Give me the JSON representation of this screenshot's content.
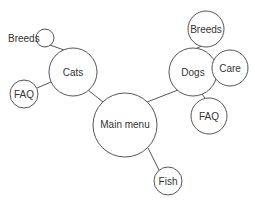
{
  "diagram": {
    "type": "bubble-sitemap",
    "nodes": {
      "main": {
        "label": "Main menu",
        "cx": 125,
        "cy": 125,
        "r": 32
      },
      "cats": {
        "label": "Cats",
        "cx": 73,
        "cy": 72,
        "r": 24
      },
      "cats_breeds": {
        "label": "Breeds",
        "cx": 45,
        "cy": 38,
        "r": 9,
        "label_x": 8,
        "label_y": 42
      },
      "cats_faq": {
        "label": "FAQ",
        "cx": 24,
        "cy": 94,
        "r": 14
      },
      "dogs": {
        "label": "Dogs",
        "cx": 193,
        "cy": 72,
        "r": 24
      },
      "dogs_breeds": {
        "label": "Breeds",
        "cx": 206,
        "cy": 29,
        "r": 18
      },
      "dogs_care": {
        "label": "Care",
        "cx": 230,
        "cy": 68,
        "r": 18
      },
      "dogs_faq": {
        "label": "FAQ",
        "cx": 209,
        "cy": 116,
        "r": 18
      },
      "fish": {
        "label": "Fish",
        "cx": 168,
        "cy": 181,
        "r": 14
      }
    },
    "edges": [
      [
        "main",
        "cats"
      ],
      [
        "main",
        "dogs"
      ],
      [
        "main",
        "fish"
      ],
      [
        "cats",
        "cats_breeds"
      ],
      [
        "cats",
        "cats_faq"
      ],
      [
        "dogs",
        "dogs_breeds"
      ],
      [
        "dogs",
        "dogs_care"
      ],
      [
        "dogs",
        "dogs_faq"
      ]
    ]
  }
}
